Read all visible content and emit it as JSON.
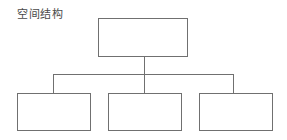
{
  "diagram": {
    "title": "空间结构",
    "type": "hierarchy-tree",
    "stroke_color": "#707070",
    "nodes": {
      "root": {
        "label": ""
      },
      "children": [
        {
          "label": ""
        },
        {
          "label": ""
        },
        {
          "label": ""
        }
      ]
    }
  }
}
